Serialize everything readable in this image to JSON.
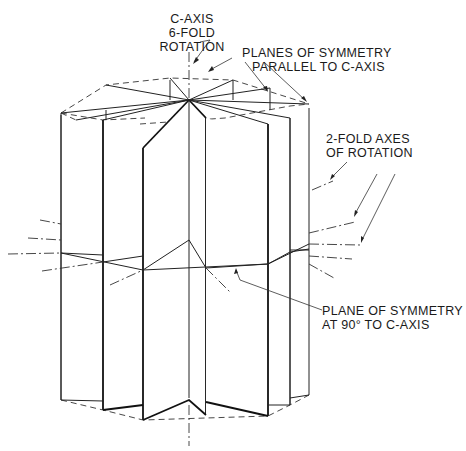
{
  "figure": {
    "labels": {
      "c_axis": [
        "C-AXIS",
        "6-FOLD",
        "ROTATION"
      ],
      "planes_parallel": [
        "PLANES OF SYMMETRY",
        "PARALLEL TO C-AXIS"
      ],
      "two_fold": [
        "2-FOLD AXES",
        "OF ROTATION"
      ],
      "plane_90": [
        "PLANE OF SYMMETRY",
        "AT 90° TO C-AXIS"
      ]
    },
    "colors": {
      "background": "#ffffff",
      "line": "#111111"
    }
  }
}
